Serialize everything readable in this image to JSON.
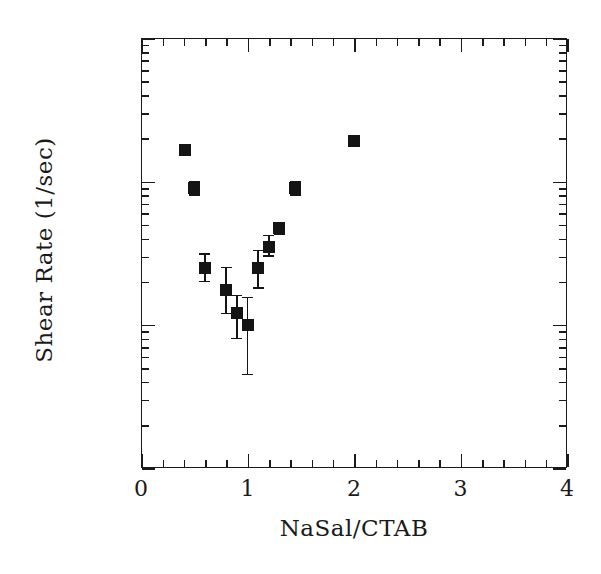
{
  "chart_data": {
    "type": "scatter",
    "title": "",
    "xlabel": "NaSal/CTAB",
    "ylabel": "Shear Rate (1/sec)",
    "xlim": [
      0,
      4
    ],
    "ylim": [
      1,
      1000
    ],
    "yscale": "log",
    "xscale": "linear",
    "grid": false,
    "legend": null,
    "xticks": [
      0,
      1,
      2,
      3,
      4
    ],
    "xtick_labels": [
      "0",
      "1",
      "2",
      "3",
      "4"
    ],
    "xminor_step": 0.2,
    "yticks": [
      1,
      10,
      100,
      1000
    ],
    "ytick_labels": [
      "1",
      "10",
      "100",
      "1000"
    ],
    "marker_style": "filled-square",
    "marker_color": "#141414",
    "error_bars": "y",
    "x": [
      0.41,
      0.5,
      0.6,
      0.8,
      0.9,
      1.0,
      1.1,
      1.2,
      1.3,
      1.45,
      2.0
    ],
    "y": [
      165,
      90,
      25,
      17.5,
      12,
      10,
      25,
      35,
      47,
      90,
      190
    ],
    "yerr_low": [
      8,
      10,
      5,
      5.5,
      4,
      5.5,
      7,
      5,
      4,
      10,
      8
    ],
    "yerr_high": [
      8,
      10,
      6,
      7.5,
      4,
      5.5,
      8,
      7,
      4,
      10,
      8
    ],
    "points": [
      {
        "x": 0.41,
        "y": 165,
        "yerr_low": 8,
        "yerr_high": 8
      },
      {
        "x": 0.5,
        "y": 90,
        "yerr_low": 10,
        "yerr_high": 10
      },
      {
        "x": 0.6,
        "y": 25,
        "yerr_low": 5,
        "yerr_high": 6
      },
      {
        "x": 0.8,
        "y": 17.5,
        "yerr_low": 5.5,
        "yerr_high": 7.5
      },
      {
        "x": 0.9,
        "y": 12,
        "yerr_low": 4,
        "yerr_high": 4
      },
      {
        "x": 1.0,
        "y": 10,
        "yerr_low": 5.5,
        "yerr_high": 5.5
      },
      {
        "x": 1.1,
        "y": 25,
        "yerr_low": 7,
        "yerr_high": 8
      },
      {
        "x": 1.2,
        "y": 35,
        "yerr_low": 5,
        "yerr_high": 7
      },
      {
        "x": 1.3,
        "y": 47,
        "yerr_low": 4,
        "yerr_high": 4
      },
      {
        "x": 1.45,
        "y": 90,
        "yerr_low": 10,
        "yerr_high": 10
      },
      {
        "x": 2.0,
        "y": 190,
        "yerr_low": 8,
        "yerr_high": 8
      }
    ]
  }
}
